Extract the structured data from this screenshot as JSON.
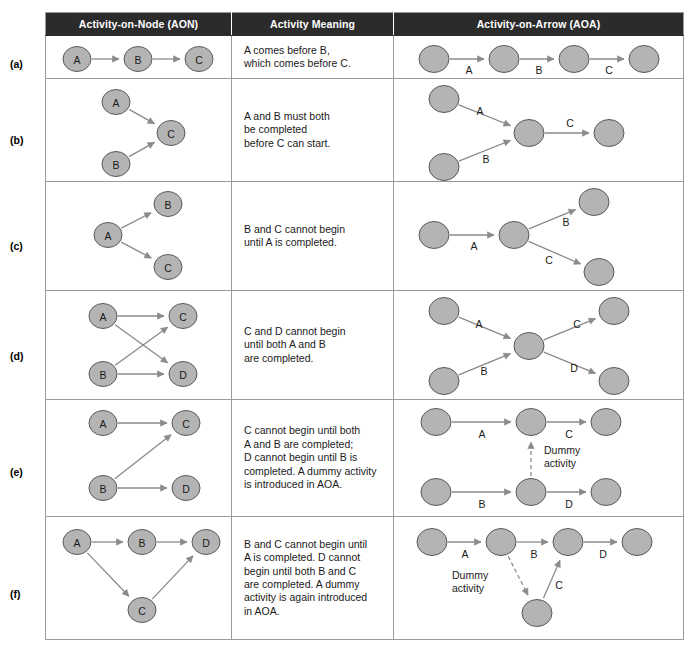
{
  "table": {
    "headers": [
      {
        "id": "aon",
        "label": "Activity-on-Node (AON)"
      },
      {
        "id": "meaning",
        "label": "Activity Meaning"
      },
      {
        "id": "aoa",
        "label": "Activity-on-Arrow (AOA)"
      }
    ],
    "rows": [
      {
        "label": "(a)",
        "meaning_lines": [
          "A comes before B,",
          "which comes before C."
        ],
        "aon": {
          "nodes": [
            {
              "id": "A",
              "label": "A",
              "cx": 31,
              "cy": 23
            },
            {
              "id": "B",
              "label": "B",
              "cx": 92,
              "cy": 23
            },
            {
              "id": "C",
              "label": "C",
              "cx": 153,
              "cy": 23
            }
          ],
          "edges": [
            {
              "from": "A",
              "to": "B",
              "label": ""
            },
            {
              "from": "B",
              "to": "C",
              "label": ""
            }
          ]
        },
        "aoa": {
          "nodes": [
            {
              "id": "1",
              "label": "",
              "cx": 40,
              "cy": 23
            },
            {
              "id": "2",
              "label": "",
              "cx": 110,
              "cy": 23
            },
            {
              "id": "3",
              "label": "",
              "cx": 180,
              "cy": 23
            },
            {
              "id": "4",
              "label": "",
              "cx": 250,
              "cy": 23
            }
          ],
          "edges": [
            {
              "from": "1",
              "to": "2",
              "label": "A",
              "lx": 75,
              "ly": 34
            },
            {
              "from": "2",
              "to": "3",
              "label": "B",
              "lx": 145,
              "ly": 34
            },
            {
              "from": "3",
              "to": "4",
              "label": "C",
              "lx": 215,
              "ly": 34
            }
          ]
        }
      },
      {
        "label": "(b)",
        "meaning_lines": [
          "A and B must both",
          "be completed",
          "before C can start."
        ],
        "aon": {
          "nodes": [
            {
              "id": "A",
              "label": "A",
              "cx": 70,
              "cy": 23
            },
            {
              "id": "C",
              "label": "C",
              "cx": 125,
              "cy": 54
            },
            {
              "id": "B",
              "label": "B",
              "cx": 70,
              "cy": 85
            }
          ],
          "edges": [
            {
              "from": "A",
              "to": "C",
              "label": ""
            },
            {
              "from": "B",
              "to": "C",
              "label": ""
            }
          ]
        },
        "aoa": {
          "nodes": [
            {
              "id": "1",
              "label": "",
              "cx": 50,
              "cy": 20
            },
            {
              "id": "2",
              "label": "",
              "cx": 50,
              "cy": 88
            },
            {
              "id": "3",
              "label": "",
              "cx": 135,
              "cy": 54
            },
            {
              "id": "4",
              "label": "",
              "cx": 215,
              "cy": 54
            }
          ],
          "edges": [
            {
              "from": "1",
              "to": "3",
              "label": "A",
              "lx": 86,
              "ly": 32
            },
            {
              "from": "2",
              "to": "3",
              "label": "B",
              "lx": 92,
              "ly": 80
            },
            {
              "from": "3",
              "to": "4",
              "label": "C",
              "lx": 176,
              "ly": 44
            }
          ]
        }
      },
      {
        "label": "(c)",
        "meaning_lines": [
          "B and C cannot begin",
          "until A is completed."
        ],
        "aon": {
          "nodes": [
            {
              "id": "B",
              "label": "B",
              "cx": 122,
              "cy": 22
            },
            {
              "id": "A",
              "label": "A",
              "cx": 62,
              "cy": 53
            },
            {
              "id": "C",
              "label": "C",
              "cx": 122,
              "cy": 85
            }
          ],
          "edges": [
            {
              "from": "A",
              "to": "B",
              "label": ""
            },
            {
              "from": "A",
              "to": "C",
              "label": ""
            }
          ]
        },
        "aoa": {
          "nodes": [
            {
              "id": "1",
              "label": "",
              "cx": 40,
              "cy": 53
            },
            {
              "id": "2",
              "label": "",
              "cx": 120,
              "cy": 53
            },
            {
              "id": "3",
              "label": "",
              "cx": 200,
              "cy": 20
            },
            {
              "id": "4",
              "label": "",
              "cx": 205,
              "cy": 90
            }
          ],
          "edges": [
            {
              "from": "1",
              "to": "2",
              "label": "A",
              "lx": 80,
              "ly": 64
            },
            {
              "from": "2",
              "to": "3",
              "label": "B",
              "lx": 172,
              "ly": 40
            },
            {
              "from": "2",
              "to": "4",
              "label": "C",
              "lx": 155,
              "ly": 78
            }
          ]
        }
      },
      {
        "label": "(d)",
        "meaning_lines": [
          "C and D cannot begin",
          "until both A and B",
          "are completed."
        ],
        "aon": {
          "nodes": [
            {
              "id": "A",
              "label": "A",
              "cx": 57,
              "cy": 25
            },
            {
              "id": "C",
              "label": "C",
              "cx": 137,
              "cy": 25
            },
            {
              "id": "B",
              "label": "B",
              "cx": 57,
              "cy": 83
            },
            {
              "id": "D",
              "label": "D",
              "cx": 137,
              "cy": 83
            }
          ],
          "edges": [
            {
              "from": "A",
              "to": "C",
              "label": ""
            },
            {
              "from": "A",
              "to": "D",
              "label": ""
            },
            {
              "from": "B",
              "to": "C",
              "label": ""
            },
            {
              "from": "B",
              "to": "D",
              "label": ""
            }
          ]
        },
        "aoa": {
          "nodes": [
            {
              "id": "1",
              "label": "",
              "cx": 50,
              "cy": 20
            },
            {
              "id": "2",
              "label": "",
              "cx": 50,
              "cy": 90
            },
            {
              "id": "3",
              "label": "",
              "cx": 135,
              "cy": 55
            },
            {
              "id": "4",
              "label": "",
              "cx": 220,
              "cy": 20
            },
            {
              "id": "5",
              "label": "",
              "cx": 220,
              "cy": 90
            }
          ],
          "edges": [
            {
              "from": "1",
              "to": "3",
              "label": "A",
              "lx": 85,
              "ly": 33
            },
            {
              "from": "2",
              "to": "3",
              "label": "B",
              "lx": 90,
              "ly": 80
            },
            {
              "from": "3",
              "to": "4",
              "label": "C",
              "lx": 183,
              "ly": 33
            },
            {
              "from": "3",
              "to": "5",
              "label": "D",
              "lx": 180,
              "ly": 77
            }
          ]
        }
      },
      {
        "label": "(e)",
        "meaning_lines": [
          "C cannot begin until both",
          "A and B are completed;",
          "D cannot begin until B is",
          "completed. A dummy activity",
          "is introduced in AOA."
        ],
        "aon": {
          "nodes": [
            {
              "id": "A",
              "label": "A",
              "cx": 57,
              "cy": 23
            },
            {
              "id": "C",
              "label": "C",
              "cx": 140,
              "cy": 23
            },
            {
              "id": "B",
              "label": "B",
              "cx": 57,
              "cy": 88
            },
            {
              "id": "D",
              "label": "D",
              "cx": 140,
              "cy": 88
            }
          ],
          "edges": [
            {
              "from": "A",
              "to": "C",
              "label": ""
            },
            {
              "from": "B",
              "to": "C",
              "label": ""
            },
            {
              "from": "B",
              "to": "D",
              "label": ""
            }
          ]
        },
        "aoa": {
          "nodes": [
            {
              "id": "1",
              "label": "",
              "cx": 42,
              "cy": 22
            },
            {
              "id": "2",
              "label": "",
              "cx": 137,
              "cy": 22
            },
            {
              "id": "3",
              "label": "",
              "cx": 212,
              "cy": 22
            },
            {
              "id": "4",
              "label": "",
              "cx": 42,
              "cy": 92
            },
            {
              "id": "5",
              "label": "",
              "cx": 137,
              "cy": 92
            },
            {
              "id": "6",
              "label": "",
              "cx": 212,
              "cy": 92
            }
          ],
          "edges": [
            {
              "from": "1",
              "to": "2",
              "label": "A",
              "lx": 88,
              "ly": 34
            },
            {
              "from": "2",
              "to": "3",
              "label": "C",
              "lx": 175,
              "ly": 34
            },
            {
              "from": "4",
              "to": "5",
              "label": "B",
              "lx": 88,
              "ly": 104
            },
            {
              "from": "5",
              "to": "6",
              "label": "D",
              "lx": 175,
              "ly": 104
            }
          ],
          "dummy": {
            "from": "5",
            "to": "2",
            "label_lines": [
              "Dummy",
              "activity"
            ],
            "lx": 150,
            "ly": 50
          }
        }
      },
      {
        "label": "(f)",
        "meaning_lines": [
          "B and C cannot begin until",
          "A is completed. D cannot",
          "begin until both B and C",
          "are completed. A dummy",
          "activity is again introduced",
          "in AOA."
        ],
        "aon": {
          "nodes": [
            {
              "id": "A",
              "label": "A",
              "cx": 31,
              "cy": 25
            },
            {
              "id": "B",
              "label": "B",
              "cx": 96,
              "cy": 25
            },
            {
              "id": "D",
              "label": "D",
              "cx": 160,
              "cy": 25
            },
            {
              "id": "C",
              "label": "C",
              "cx": 96,
              "cy": 93
            }
          ],
          "edges": [
            {
              "from": "A",
              "to": "B",
              "label": ""
            },
            {
              "from": "B",
              "to": "D",
              "label": ""
            },
            {
              "from": "A",
              "to": "C",
              "label": ""
            },
            {
              "from": "C",
              "to": "D",
              "label": ""
            }
          ]
        },
        "aoa": {
          "nodes": [
            {
              "id": "1",
              "label": "",
              "cx": 38,
              "cy": 25
            },
            {
              "id": "2",
              "label": "",
              "cx": 107,
              "cy": 25
            },
            {
              "id": "3",
              "label": "",
              "cx": 174,
              "cy": 25
            },
            {
              "id": "4",
              "label": "",
              "cx": 243,
              "cy": 25
            },
            {
              "id": "5",
              "label": "",
              "cx": 143,
              "cy": 96
            }
          ],
          "edges": [
            {
              "from": "1",
              "to": "2",
              "label": "A",
              "lx": 71,
              "ly": 37
            },
            {
              "from": "2",
              "to": "3",
              "label": "B",
              "lx": 140,
              "ly": 37
            },
            {
              "from": "3",
              "to": "4",
              "label": "D",
              "lx": 209,
              "ly": 37
            },
            {
              "from": "5",
              "to": "3",
              "label": "C",
              "lx": 165,
              "ly": 68
            }
          ],
          "dummy": {
            "from": "2",
            "to": "5",
            "label_lines": [
              "Dummy",
              "activity"
            ],
            "lx": 58,
            "ly": 58
          }
        }
      }
    ]
  },
  "style": {
    "header_bg": "#2b2b2b",
    "header_fg": "#ffffff",
    "node_fill": "#b4b4b4",
    "node_stroke": "#5a5a5a",
    "edge_color": "#8a8a8a",
    "grid_color": "#9a9a9a"
  }
}
